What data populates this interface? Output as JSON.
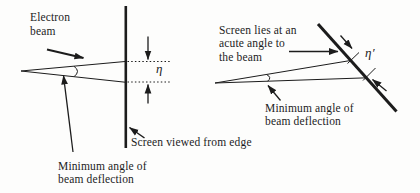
{
  "figure": {
    "description_type": "physics-diagram",
    "colors": {
      "ink": "#1c1c1c",
      "bg": "#fdfdfc"
    },
    "left_diagram": {
      "beam_label_lines": [
        "Electron",
        "beam"
      ],
      "eta_label": "η",
      "screen_label": "Screen viewed from edge",
      "deflection_label_lines": [
        "Minimum angle of",
        "beam deflection"
      ]
    },
    "right_diagram": {
      "screen_label_lines": [
        "Screen lies at an",
        "acute angle to",
        "the beam"
      ],
      "eta_prime_label": "η′",
      "deflection_label_lines": [
        "Minimum angle of",
        "beam deflection"
      ]
    }
  }
}
